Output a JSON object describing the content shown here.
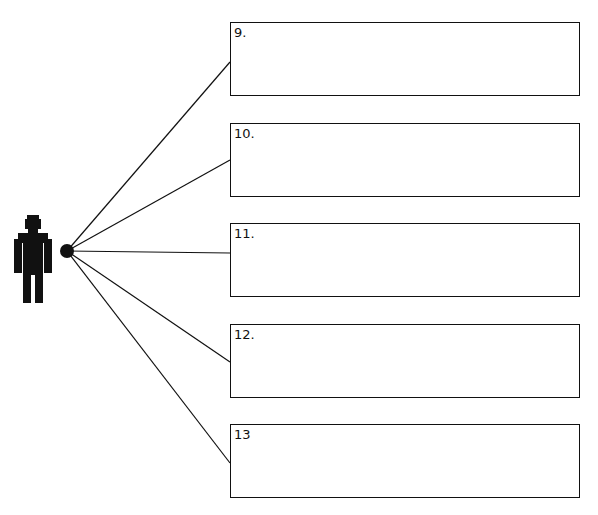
{
  "diagram": {
    "type": "radial-connector",
    "hub": {
      "icon": "person-icon",
      "connector": "dot"
    },
    "boxes": [
      {
        "label": "9.",
        "top": 22
      },
      {
        "label": "10.",
        "top": 123
      },
      {
        "label": "11.",
        "top": 223
      },
      {
        "label": "12.",
        "top": 324
      },
      {
        "label": "13",
        "top": 424
      }
    ],
    "colors": {
      "stroke": "#111111",
      "background": "#ffffff"
    }
  }
}
